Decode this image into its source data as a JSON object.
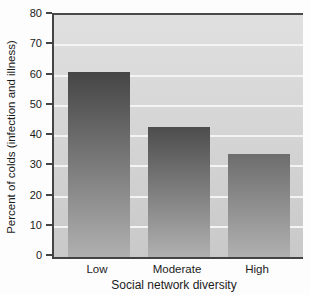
{
  "chart_data": {
    "type": "bar",
    "title": "",
    "categories": [
      "Low",
      "Moderate",
      "High"
    ],
    "values": [
      61,
      43,
      34
    ],
    "xlabel": "Social network diversity",
    "ylabel": "Percent of colds (infection and illness)",
    "ylim": [
      0,
      80
    ],
    "yticks": [
      0,
      10,
      20,
      30,
      40,
      50,
      60,
      70,
      80
    ],
    "grid": "horizontal",
    "legend": "none",
    "colors": {
      "bar_top": [
        "#454545",
        "#4d4d4d",
        "#6d6d6d"
      ],
      "bar_bottom": "#b0b0b0",
      "plot_bg_top": "#e0e0e0",
      "plot_bg_bottom": "#c9c9c9",
      "gridline": "#f4f4f4",
      "axis": "#444444",
      "text": "#1b1b1b"
    }
  }
}
